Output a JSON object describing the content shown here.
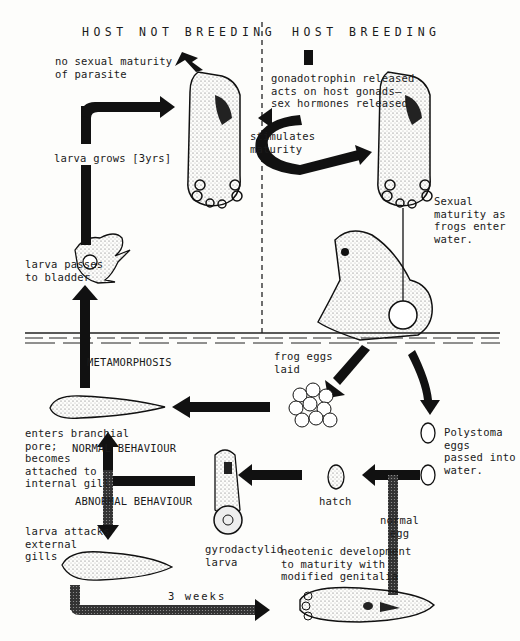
{
  "diagram": {
    "headers": {
      "left": "HOST NOT BREEDING",
      "right": "HOST BREEDING"
    },
    "labels": {
      "no_maturity": "no sexual maturity\nof parasite",
      "gonadotrophin": "gonadotrophin released\nacts on host gonads—\nsex hormones released",
      "stimulates": "stimulates\nmaturity",
      "larva_grows": "larva grows [3yrs]",
      "larva_passes": "larva passes\nto bladder",
      "sexual_maturity": "Sexual\nmaturity as\nfrogs enter\nwater.",
      "metamorphosis": "METAMORPHOSIS",
      "frog_eggs": "frog eggs\nlaid",
      "polystoma_eggs": "Polystoma\neggs\npassed into\nwater.",
      "enters_branchial": "enters branchial\npore;\nbecomes\nattached to\ninternal gill",
      "normal_behaviour": "NORMAL  BEHAVIOUR",
      "abnormal_behaviour": "ABNORMAL BEHAVIOUR",
      "hatch": "hatch",
      "normal_egg": "normal\negg",
      "larva_attacks": "larva attacks\nexternal\ngills",
      "gyrodactylid": "gyrodactylid\nlarva",
      "neotenic": "neotenic development\nto maturity with\nmodified genitalia",
      "three_weeks": "3 weeks"
    },
    "colors": {
      "ink": "#1a1a1a",
      "paper": "#fdfdfb",
      "arrow": "#111111"
    }
  }
}
